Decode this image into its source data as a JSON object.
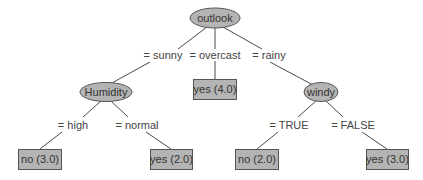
{
  "tree": {
    "root": {
      "label": "outlook"
    },
    "internal_nodes": [
      {
        "label": "Humidity"
      },
      {
        "label": "windy"
      }
    ],
    "edges": {
      "sunny": "= sunny",
      "overcast": "= overcast",
      "rainy": "= rainy",
      "high": "= high",
      "normal": "= normal",
      "true": "= TRUE",
      "false": "= FALSE"
    },
    "leaves": [
      {
        "label": "yes (4.0)"
      },
      {
        "label": "no (3.0)"
      },
      {
        "label": "yes (2.0)"
      },
      {
        "label": "no (2.0)"
      },
      {
        "label": "yes (3.0)"
      }
    ]
  },
  "colors": {
    "node_fill": "#b4b4b4",
    "node_stroke": "#555555",
    "edge": "#4a4a4a",
    "background": "#ffffff"
  }
}
